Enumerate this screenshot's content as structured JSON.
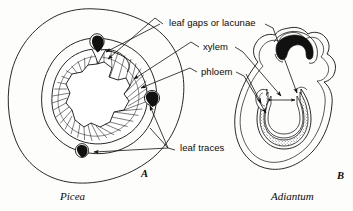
{
  "figure": {
    "type": "botanical-anatomy-diagram",
    "background_color": "#fdfdfb",
    "ink_color": "#111111"
  },
  "labels": {
    "leaf_gaps": "leaf gaps or lacunae",
    "xylem": "xylem",
    "phloem": "phloem",
    "leaf_traces": "leaf traces"
  },
  "panels": [
    {
      "letter": "A",
      "caption": "Picea",
      "features": [
        "leaf gaps or lacunae",
        "xylem",
        "phloem",
        "leaf traces"
      ]
    },
    {
      "letter": "B",
      "caption": "Adiantum",
      "features": [
        "leaf gaps or lacunae",
        "xylem",
        "phloem"
      ]
    }
  ],
  "panel_letters": {
    "a": "A",
    "b": "B"
  },
  "captions": {
    "a": "Picea",
    "b": "Adiantum"
  }
}
